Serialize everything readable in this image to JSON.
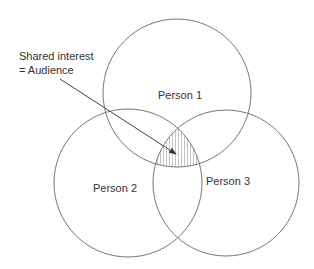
{
  "diagram": {
    "type": "venn",
    "circles": [
      {
        "id": "person1",
        "label": "Person 1",
        "cx": 177,
        "cy": 93,
        "r": 74
      },
      {
        "id": "person2",
        "label": "Person 2",
        "cx": 128,
        "cy": 183,
        "r": 74
      },
      {
        "id": "person3",
        "label": "Person 3",
        "cx": 226,
        "cy": 183,
        "r": 73
      }
    ],
    "annotation": {
      "line1": "Shared interest",
      "line2": "= Audience",
      "points_to": "intersection of all three circles (hatched)"
    },
    "colors": {
      "stroke": "#777777",
      "text": "#333333",
      "hatch": "#999999",
      "background": "#ffffff"
    }
  }
}
